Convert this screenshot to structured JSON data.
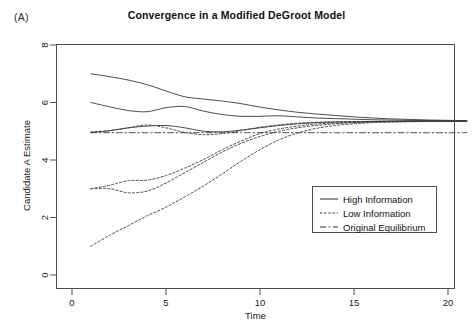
{
  "panel": {
    "label": "(A)"
  },
  "chart_data": {
    "type": "line",
    "title": "Convergence in a Modified DeGroot Model",
    "xlabel": "Time",
    "ylabel": "Candidate A Estimate",
    "xlim": [
      0,
      21
    ],
    "ylim": [
      0,
      8.6
    ],
    "xticks": [
      0,
      5,
      10,
      15,
      20
    ],
    "yticks": [
      0,
      2,
      4,
      6,
      8
    ],
    "xticklabels": [
      "0",
      "5",
      "10",
      "15",
      "20"
    ],
    "yticklabels": [
      "0",
      "2",
      "4",
      "6",
      "8"
    ],
    "grid": false,
    "legend_position": "center-right",
    "legend": [
      {
        "label": "High Information",
        "style": "solid"
      },
      {
        "label": "Low Information",
        "style": "dotted"
      },
      {
        "label": "Original Equilibrium",
        "style": "dashdot"
      }
    ],
    "x": [
      1,
      2,
      3,
      4,
      5,
      6,
      7,
      8,
      9,
      10,
      11,
      12,
      13,
      14,
      15,
      16,
      17,
      18,
      19,
      20,
      21
    ],
    "series": [
      {
        "name": "High Information 1",
        "style": "solid",
        "values": [
          7.0,
          6.9,
          6.78,
          6.62,
          6.4,
          6.2,
          6.12,
          6.05,
          5.96,
          5.84,
          5.74,
          5.66,
          5.6,
          5.55,
          5.5,
          5.46,
          5.43,
          5.41,
          5.39,
          5.38,
          5.37
        ]
      },
      {
        "name": "High Information 2",
        "style": "solid",
        "values": [
          6.0,
          5.85,
          5.72,
          5.68,
          5.82,
          5.86,
          5.7,
          5.58,
          5.52,
          5.52,
          5.54,
          5.5,
          5.46,
          5.44,
          5.42,
          5.4,
          5.39,
          5.38,
          5.37,
          5.36,
          5.36
        ]
      },
      {
        "name": "High Information 3",
        "style": "solid",
        "values": [
          4.95,
          5.02,
          5.12,
          5.18,
          5.2,
          5.12,
          5.0,
          4.98,
          5.04,
          5.12,
          5.2,
          5.26,
          5.3,
          5.32,
          5.33,
          5.34,
          5.34,
          5.35,
          5.35,
          5.35,
          5.35
        ]
      },
      {
        "name": "Low Information 1",
        "style": "dotted",
        "values": [
          4.98,
          5.02,
          5.12,
          5.22,
          5.12,
          4.96,
          4.88,
          4.92,
          5.02,
          5.14,
          5.22,
          5.28,
          5.31,
          5.33,
          5.34,
          5.34,
          5.35,
          5.35,
          5.35,
          5.35,
          5.35
        ]
      },
      {
        "name": "Low Information 2",
        "style": "dotted",
        "values": [
          3.0,
          3.12,
          3.28,
          3.3,
          3.46,
          3.72,
          4.02,
          4.36,
          4.66,
          4.92,
          5.08,
          5.18,
          5.25,
          5.29,
          5.31,
          5.33,
          5.34,
          5.34,
          5.35,
          5.35,
          5.35
        ]
      },
      {
        "name": "Low Information 3",
        "style": "dotted",
        "values": [
          3.0,
          3.0,
          2.86,
          2.92,
          3.2,
          3.56,
          3.92,
          4.28,
          4.58,
          4.82,
          5.0,
          5.12,
          5.2,
          5.26,
          5.3,
          5.32,
          5.33,
          5.34,
          5.34,
          5.35,
          5.35
        ]
      },
      {
        "name": "Low Information 4",
        "style": "dotted",
        "values": [
          1.0,
          1.38,
          1.72,
          2.06,
          2.36,
          2.72,
          3.1,
          3.52,
          3.96,
          4.36,
          4.7,
          4.94,
          5.1,
          5.2,
          5.26,
          5.3,
          5.32,
          5.33,
          5.34,
          5.34,
          5.35
        ]
      },
      {
        "name": "Original Equilibrium",
        "style": "dashdot",
        "values": [
          4.95,
          4.95,
          4.95,
          4.95,
          4.95,
          4.95,
          4.95,
          4.95,
          4.95,
          4.95,
          4.95,
          4.95,
          4.95,
          4.95,
          4.95,
          4.95,
          4.95,
          4.95,
          4.95,
          4.95,
          4.95
        ]
      }
    ]
  }
}
